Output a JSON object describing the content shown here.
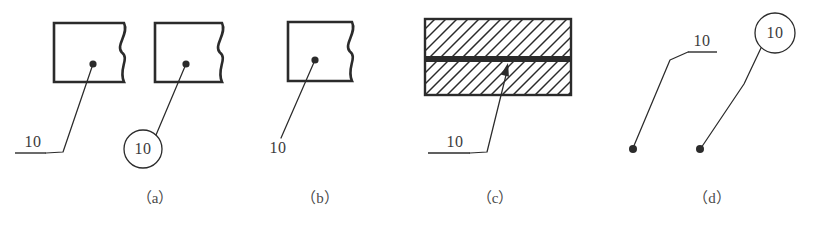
{
  "figure": {
    "width": 813,
    "height": 225,
    "background": "#ffffff",
    "ink": "#2b2b2b",
    "caption_color": "#4a4a4a"
  },
  "panels": [
    {
      "id": "a",
      "caption": "（a）",
      "caption_x": 155,
      "caption_y": 186,
      "items": [
        {
          "kind": "broken-rect-with-dot-leader-shelf",
          "number": "10",
          "number_x": 33,
          "number_y": 142,
          "shelf": {
            "x1": 15,
            "x2": 46,
            "y": 153
          },
          "leader": [
            [
              46,
              153
            ],
            [
              63,
              152
            ],
            [
              93,
              64
            ]
          ],
          "dot": {
            "x": 93,
            "y": 64,
            "r": 3.6
          },
          "rect": {
            "x": 54,
            "y": 23,
            "w": 64,
            "h": 59
          },
          "break_edge": {
            "x": 124,
            "amp": 6
          }
        },
        {
          "kind": "broken-rect-with-dot-leader-circle",
          "number": "10",
          "number_x": 143,
          "number_y": 149,
          "circle": {
            "cx": 143,
            "cy": 149,
            "r": 19
          },
          "leader": [
            [
              156,
              135
            ],
            [
              186,
              64
            ]
          ],
          "dot": {
            "x": 186,
            "y": 64,
            "r": 3.6
          },
          "rect": {
            "x": 155,
            "y": 23,
            "w": 62,
            "h": 59
          },
          "break_edge": {
            "x": 222,
            "amp": 6
          }
        }
      ]
    },
    {
      "id": "b",
      "caption": "（b）",
      "caption_x": 320,
      "caption_y": 186,
      "items": [
        {
          "kind": "broken-rect-with-dot-leader-plain",
          "number": "10",
          "number_x": 278,
          "number_y": 148,
          "leader": [
            [
              281,
              138
            ],
            [
              315,
              60
            ]
          ],
          "dot": {
            "x": 315,
            "y": 60,
            "r": 3.6
          },
          "rect": {
            "x": 288,
            "y": 22,
            "w": 58,
            "h": 59
          },
          "break_edge": {
            "x": 352,
            "amp": 6
          }
        }
      ]
    },
    {
      "id": "c",
      "caption": "（c）",
      "caption_x": 495,
      "caption_y": 186,
      "items": [
        {
          "kind": "hatched-section-with-arrow-leader-shelf",
          "number": "10",
          "number_x": 455,
          "number_y": 142,
          "shelf": {
            "x1": 428,
            "x2": 470,
            "y": 153
          },
          "leader": [
            [
              470,
              153
            ],
            [
              487,
              152
            ],
            [
              508,
              67
            ]
          ],
          "arrow": {
            "x": 508,
            "y": 63,
            "angle": -76
          },
          "section": {
            "x": 425,
            "y": 19,
            "w": 146,
            "h": 76,
            "band_y": 56,
            "band_h": 6,
            "hatch_spacing": 11,
            "hatch_angle": 45
          }
        }
      ]
    },
    {
      "id": "d",
      "caption": "（d）",
      "caption_x": 712,
      "caption_y": 186,
      "items": [
        {
          "kind": "free-dot-leader-shelf",
          "number": "10",
          "number_x": 702,
          "number_y": 41,
          "shelf": {
            "x1": 688,
            "x2": 717,
            "y": 52
          },
          "leader": [
            [
              688,
              52
            ],
            [
              670,
              60
            ],
            [
              633,
              148
            ]
          ],
          "dot": {
            "x": 633,
            "y": 149,
            "r": 4
          }
        },
        {
          "kind": "free-dot-leader-circle",
          "number": "10",
          "number_x": 775,
          "number_y": 33,
          "circle": {
            "cx": 775,
            "cy": 33,
            "r": 20
          },
          "leader": [
            [
              761,
              48
            ],
            [
              744,
              84
            ],
            [
              701,
              148
            ]
          ],
          "dot": {
            "x": 700,
            "y": 149,
            "r": 4
          }
        }
      ]
    }
  ]
}
